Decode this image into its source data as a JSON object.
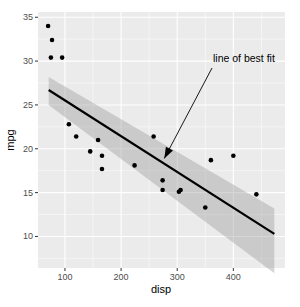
{
  "chart_data": {
    "type": "scatter",
    "title": "",
    "xlabel": "disp",
    "ylabel": "mpg",
    "xlim": [
      52,
      492
    ],
    "ylim": [
      6.4,
      35.6
    ],
    "x_ticks": [
      100,
      200,
      300,
      400
    ],
    "y_ticks": [
      10,
      15,
      20,
      25,
      30,
      35
    ],
    "grid": true,
    "legend": null,
    "points": [
      {
        "x": 70,
        "y": 34.0
      },
      {
        "x": 77,
        "y": 32.4
      },
      {
        "x": 75,
        "y": 30.4
      },
      {
        "x": 95,
        "y": 30.4
      },
      {
        "x": 107,
        "y": 22.8
      },
      {
        "x": 120,
        "y": 21.4
      },
      {
        "x": 159,
        "y": 21.0
      },
      {
        "x": 145,
        "y": 19.7
      },
      {
        "x": 166,
        "y": 19.2
      },
      {
        "x": 166,
        "y": 17.7
      },
      {
        "x": 224,
        "y": 18.1
      },
      {
        "x": 258,
        "y": 21.4
      },
      {
        "x": 274,
        "y": 16.4
      },
      {
        "x": 274,
        "y": 15.3
      },
      {
        "x": 303,
        "y": 15.1
      },
      {
        "x": 306,
        "y": 15.3
      },
      {
        "x": 350,
        "y": 13.3
      },
      {
        "x": 360,
        "y": 18.7
      },
      {
        "x": 400,
        "y": 19.2
      },
      {
        "x": 441,
        "y": 14.8
      }
    ],
    "fit_line": {
      "method": "lm",
      "start": {
        "x": 71,
        "y": 26.7
      },
      "end": {
        "x": 473,
        "y": 10.3
      },
      "ci_band": {
        "start": {
          "lower": 25.0,
          "upper": 28.2
        },
        "end": {
          "lower": 5.8,
          "upper": 13.2
        }
      }
    },
    "annotations": [
      {
        "text": "line of best fit",
        "text_x": 280,
        "text_y": 29.5,
        "arrow_to": {
          "x": 277,
          "y": 18.9
        }
      }
    ],
    "colors": {
      "panel": "#ebebeb",
      "grid": "#ffffff",
      "points": "#000000",
      "line": "#000000",
      "band": "#999999"
    }
  },
  "labels": {
    "xlabel": "disp",
    "ylabel": "mpg",
    "annotation": "line of best fit",
    "x_ticks": [
      "100",
      "200",
      "300",
      "400"
    ],
    "y_ticks": [
      "10",
      "15",
      "20",
      "25",
      "30",
      "35"
    ]
  }
}
